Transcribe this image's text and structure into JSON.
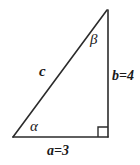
{
  "figure": {
    "kind": "right-triangle-diagram",
    "background_color": "#ffffff",
    "stroke_color": "#2b2b2b",
    "geometry": {
      "vertex_bottom_left": [
        13,
        137
      ],
      "vertex_bottom_right": [
        108,
        137
      ],
      "vertex_apex": [
        107,
        10
      ],
      "right_angle_marker_size": 10
    }
  },
  "labels": {
    "angle_beta": "β",
    "angle_alpha": "α",
    "side_hypotenuse": "c",
    "side_vertical": "b=4",
    "side_horizontal": "a=3"
  }
}
